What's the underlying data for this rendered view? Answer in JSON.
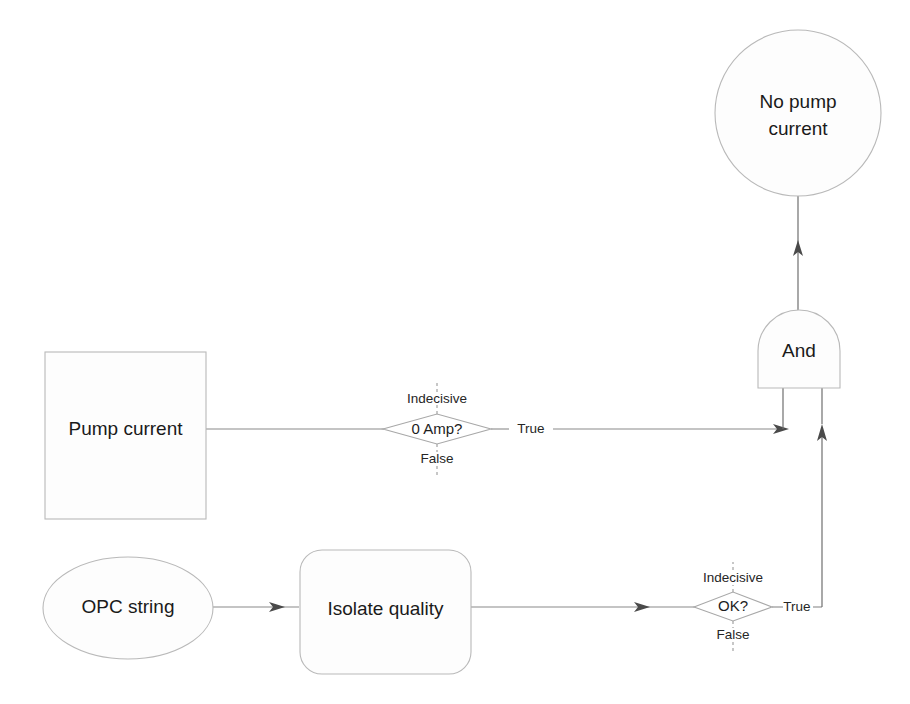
{
  "diagram": {
    "canvas": {
      "width": 910,
      "height": 704
    },
    "colors": {
      "background": "#ffffff",
      "node_fill": "#fdfdfd",
      "node_stroke": "#b9b9b9",
      "edge_stroke": "#6f6f6f",
      "text": "#1a1a1a"
    },
    "nodes": {
      "output_circle": {
        "label_line1": "No pump",
        "label_line2": "current",
        "shape": "circle"
      },
      "and_gate": {
        "label": "And",
        "shape": "and-gate"
      },
      "pump_current": {
        "label": "Pump current",
        "shape": "rectangle"
      },
      "opc_string": {
        "label": "OPC string",
        "shape": "ellipse"
      },
      "isolate_quality": {
        "label": "Isolate quality",
        "shape": "rounded-rectangle"
      }
    },
    "decisions": {
      "zero_amp": {
        "label": "0 Amp?",
        "indecisive": "Indecisive",
        "false": "False",
        "true": "True"
      },
      "ok": {
        "label": "OK?",
        "indecisive": "Indecisive",
        "false": "False",
        "true": "True"
      }
    }
  }
}
